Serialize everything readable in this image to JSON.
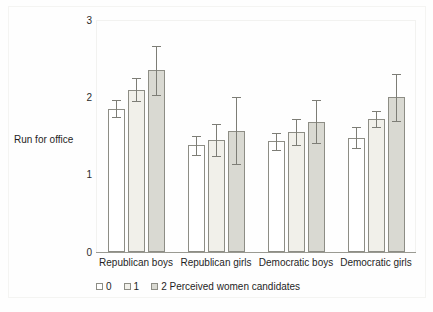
{
  "chart_data": {
    "type": "bar",
    "title": "",
    "xlabel": "",
    "ylabel": "Run for office",
    "ylim": [
      0,
      3
    ],
    "yticks": [
      0,
      1,
      2,
      3
    ],
    "ytick_labels": [
      "0",
      "1",
      "2",
      "3"
    ],
    "grid": false,
    "legend_position": "bottom",
    "legend_title": "Perceived women candidates",
    "categories": [
      "Republican boys",
      "Republican girls",
      "Democratic boys",
      "Democratic girls"
    ],
    "series": [
      {
        "name": "0",
        "color": "#ffffff",
        "values": [
          1.85,
          1.38,
          1.43,
          1.48
        ],
        "err_low": [
          1.74,
          1.26,
          1.32,
          1.35
        ],
        "err_high": [
          1.96,
          1.5,
          1.54,
          1.61
        ]
      },
      {
        "name": "1",
        "color": "#f1f0ea",
        "values": [
          2.1,
          1.45,
          1.55,
          1.72
        ],
        "err_low": [
          1.95,
          1.24,
          1.38,
          1.62
        ],
        "err_high": [
          2.25,
          1.66,
          1.72,
          1.82
        ]
      },
      {
        "name": "2 Perceived women candidates",
        "color": "#d9d9d2",
        "values": [
          2.35,
          1.57,
          1.68,
          2.0
        ],
        "err_low": [
          2.03,
          1.14,
          1.41,
          1.69
        ],
        "err_high": [
          2.67,
          2.01,
          1.96,
          2.3
        ]
      }
    ]
  },
  "axis": {
    "y_title": "Run for office",
    "ticks": [
      {
        "value": "3"
      },
      {
        "value": "2"
      },
      {
        "value": "1"
      },
      {
        "value": "0"
      }
    ]
  },
  "legend": {
    "entries": [
      {
        "label": "0"
      },
      {
        "label": "1"
      },
      {
        "label": "2 Perceived women candidates"
      }
    ]
  }
}
